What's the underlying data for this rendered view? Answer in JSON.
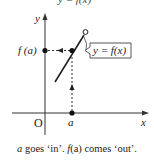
{
  "figure": {
    "top_cropped_text": "y = f(x)",
    "y_axis_label": "y",
    "x_axis_label": "x",
    "origin_label": "O",
    "input_label": "a",
    "output_label": "f (a)",
    "curve_label": "y = f(x)",
    "caption": {
      "a": "a",
      "goes": " goes ‘in’. ",
      "fa": "f",
      "fa_paren": "(a)",
      "comes": " comes ‘out’."
    },
    "colors": {
      "ink": "#222222",
      "background": "#ffffff"
    }
  }
}
